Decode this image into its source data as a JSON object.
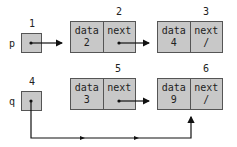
{
  "pointers": [
    {
      "id": "1",
      "var": "p"
    },
    {
      "id": "4",
      "var": "q"
    }
  ],
  "nodes": [
    {
      "id": "2",
      "data_label": "data",
      "data": "2",
      "next_label": "next",
      "next": ""
    },
    {
      "id": "3",
      "data_label": "data",
      "data": "4",
      "next_label": "next",
      "next": "/"
    },
    {
      "id": "5",
      "data_label": "data",
      "data": "3",
      "next_label": "next",
      "next": ""
    },
    {
      "id": "6",
      "data_label": "data",
      "data": "9",
      "next_label": "next",
      "next": "/"
    }
  ],
  "colors": {
    "box_fill": "#c8c8c8",
    "stroke": "#555555",
    "arrow": "#111111"
  }
}
